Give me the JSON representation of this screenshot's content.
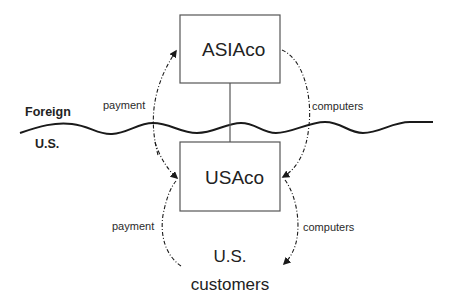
{
  "diagram": {
    "title": "",
    "colors": {
      "line": "#1a1a1a",
      "box_border": "#555555",
      "text": "#222222",
      "background": "#ffffff"
    },
    "regions": {
      "upper": "Foreign",
      "lower": "U.S."
    },
    "nodes": [
      {
        "id": "asiaco",
        "label": "ASIAco",
        "x": 180,
        "y": 15,
        "w": 100,
        "h": 68
      },
      {
        "id": "usaco",
        "label": "USAco",
        "x": 180,
        "y": 142,
        "w": 100,
        "h": 69
      },
      {
        "id": "us_customers",
        "label_line1": "U.S.",
        "label_line2": "customers"
      }
    ],
    "edges": [
      {
        "from": "usaco",
        "to": "asiaco",
        "label": "payment",
        "style": "dash-dot",
        "side": "left"
      },
      {
        "from": "asiaco",
        "to": "usaco",
        "label": "computers",
        "style": "dash-dot",
        "side": "right"
      },
      {
        "from": "us_customers",
        "to": "usaco",
        "label": "payment",
        "style": "dash-dot",
        "side": "left"
      },
      {
        "from": "usaco",
        "to": "us_customers",
        "label": "computers",
        "style": "dash-dot",
        "side": "right"
      },
      {
        "from": "asiaco",
        "to": "usaco",
        "label": "",
        "style": "solid",
        "side": "center"
      }
    ],
    "labels": {
      "payment_upper": "payment",
      "computers_upper": "computers",
      "payment_lower": "payment",
      "computers_lower": "computers",
      "asiaco": "ASIAco",
      "usaco": "USAco",
      "customers_line1": "U.S.",
      "customers_line2": "customers"
    },
    "border_line": "wavy boundary separating Foreign and U.S."
  }
}
